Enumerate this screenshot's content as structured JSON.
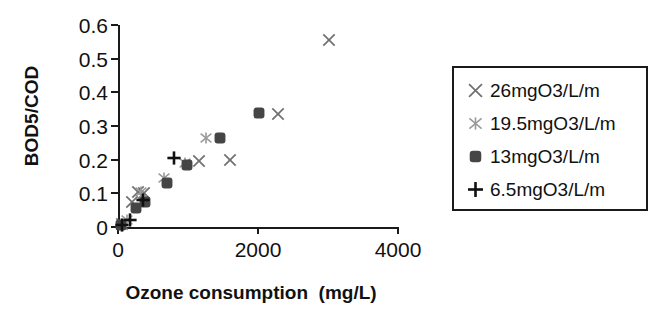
{
  "chart_data": {
    "type": "scatter",
    "title": "",
    "xlabel": "Ozone consumption  (mg/L)",
    "ylabel": "BOD5/COD",
    "xlim": [
      0,
      4000
    ],
    "ylim": [
      0,
      0.6
    ],
    "xticks": [
      0,
      2000,
      4000
    ],
    "xtick_labels": [
      "0",
      "2000",
      "4000"
    ],
    "yticks": [
      0,
      0.1,
      0.2,
      0.3,
      0.4,
      0.5,
      0.6
    ],
    "ytick_labels": [
      "0",
      "0.1",
      "0.2",
      "0.3",
      "0.4",
      "0.5",
      "0.6"
    ],
    "grid": false,
    "legend_position": "right-outside",
    "series": [
      {
        "name": "26mgO3/L/m",
        "marker": "x-cross",
        "color": "#707070",
        "points": [
          [
            60,
            0.01
          ],
          [
            200,
            0.075
          ],
          [
            290,
            0.105
          ],
          [
            370,
            0.1
          ],
          [
            1150,
            0.195
          ],
          [
            1600,
            0.2
          ],
          [
            2280,
            0.335
          ],
          [
            3020,
            0.555
          ]
        ]
      },
      {
        "name": "19.5mgO3/L/m",
        "marker": "asterisk",
        "color": "#999999",
        "points": [
          [
            130,
            0.02
          ],
          [
            330,
            0.105
          ],
          [
            660,
            0.145
          ],
          [
            960,
            0.19
          ],
          [
            1250,
            0.265
          ]
        ]
      },
      {
        "name": "13mgO3/L/m",
        "marker": "filled-square",
        "color": "#454545",
        "points": [
          [
            40,
            0.005
          ],
          [
            250,
            0.055
          ],
          [
            380,
            0.075
          ],
          [
            700,
            0.13
          ],
          [
            980,
            0.185
          ],
          [
            1450,
            0.265
          ],
          [
            2010,
            0.34
          ]
        ]
      },
      {
        "name": "6.5mgO3/L/m",
        "marker": "plus",
        "color": "#111111",
        "points": [
          [
            50,
            0.005
          ],
          [
            170,
            0.02
          ],
          [
            350,
            0.08
          ],
          [
            800,
            0.205
          ]
        ]
      }
    ]
  },
  "legend": {
    "items": [
      {
        "label": "26mgO3/L/m",
        "marker": "x-cross",
        "color": "#707070"
      },
      {
        "label": "19.5mgO3/L/m",
        "marker": "asterisk",
        "color": "#999999"
      },
      {
        "label": "13mgO3/L/m",
        "marker": "filled-square",
        "color": "#454545"
      },
      {
        "label": "6.5mgO3/L/m",
        "marker": "plus",
        "color": "#111111"
      }
    ]
  }
}
